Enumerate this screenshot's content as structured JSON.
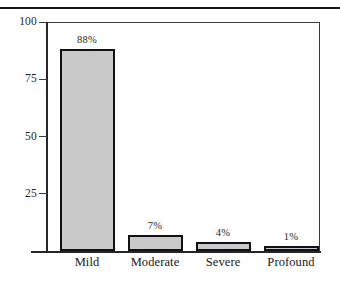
{
  "header": {
    "cutoff_text_fragment": "· ·",
    "rule_color": "#17171a"
  },
  "chart_data": {
    "type": "bar",
    "title": "",
    "subtitle": "",
    "xlabel": "",
    "ylabel": "",
    "categories": [
      "Mild",
      "Moderate",
      "Severe",
      "Profound"
    ],
    "values": [
      88,
      7,
      4,
      1
    ],
    "value_labels": [
      "88%",
      "7%",
      "4%",
      "1%"
    ],
    "ylim": [
      0,
      100
    ],
    "ytick_labels": [
      "100",
      "75",
      "50",
      "25"
    ],
    "ytick_values": [
      100,
      75,
      50,
      25
    ],
    "grid": false,
    "legend": null,
    "bar_fill_color": "#c9c9c9",
    "bar_border_color": "#111114",
    "axis_color": "#26262a",
    "text_color": "#17171a"
  }
}
